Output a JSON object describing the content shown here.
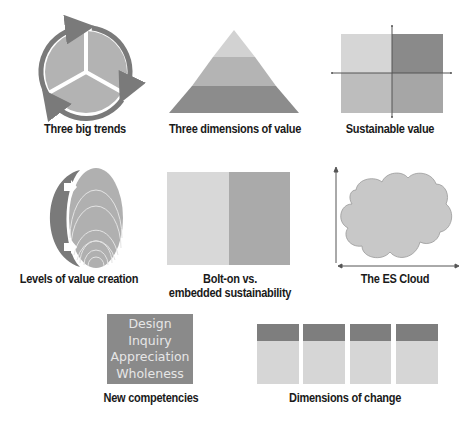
{
  "diagrams": [
    {
      "id": "three-big-trends",
      "caption": "Three big trends",
      "shape": "circle divided into three segments with circular arrows"
    },
    {
      "id": "three-dimensions-of-value",
      "caption": "Three dimensions of value",
      "shape": "three-layer pyramid"
    },
    {
      "id": "sustainable-value",
      "caption": "Sustainable value",
      "shape": "2x2 quadrant grid with axes"
    },
    {
      "id": "levels-of-value-creation",
      "caption": "Levels of value creation",
      "shape": "nested ellipses with arc and arrows"
    },
    {
      "id": "bolt-on-vs-embedded",
      "caption_line1": "Bolt-on vs.",
      "caption_line2": "embedded sustainability",
      "shape": "two-panel rectangle"
    },
    {
      "id": "es-cloud",
      "caption": "The ES Cloud",
      "shape": "cloud on x/y axes"
    },
    {
      "id": "new-competencies",
      "caption": "New competencies",
      "shape": "text box",
      "items": [
        "Design",
        "Inquiry",
        "Appreciation",
        "Wholeness"
      ]
    },
    {
      "id": "dimensions-of-change",
      "caption": "Dimensions of change",
      "shape": "four columns with dark headers",
      "columns": 4
    }
  ],
  "colors": {
    "light": "#d6d6d6",
    "medium": "#bdbdbd",
    "mid_dark": "#a8a8a8",
    "dark": "#8a8a8a",
    "darker": "#7a7a7a",
    "caption_text": "#1a1a1a"
  }
}
